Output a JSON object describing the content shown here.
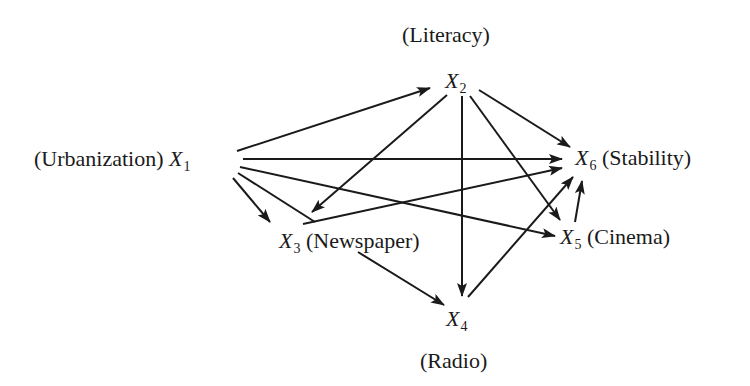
{
  "diagram": {
    "type": "path-diagram",
    "nodes": [
      {
        "id": "X1",
        "var": "X",
        "sub": "1",
        "label": "(Urbanization)",
        "label_side": "left"
      },
      {
        "id": "X2",
        "var": "X",
        "sub": "2",
        "label": "(Literacy)",
        "label_side": "above"
      },
      {
        "id": "X3",
        "var": "X",
        "sub": "3",
        "label": "(Newspaper)",
        "label_side": "right"
      },
      {
        "id": "X4",
        "var": "X",
        "sub": "4",
        "label": "(Radio)",
        "label_side": "below"
      },
      {
        "id": "X5",
        "var": "X",
        "sub": "5",
        "label": "(Cinema)",
        "label_side": "right"
      },
      {
        "id": "X6",
        "var": "X",
        "sub": "6",
        "label": "(Stability)",
        "label_side": "right"
      }
    ],
    "edges": [
      {
        "from": "X1",
        "to": "X2"
      },
      {
        "from": "X1",
        "to": "X6"
      },
      {
        "from": "X1",
        "to": "X5"
      },
      {
        "from": "X1",
        "to": "X3"
      },
      {
        "from": "X2",
        "to": "X3"
      },
      {
        "from": "X2",
        "to": "X4"
      },
      {
        "from": "X2",
        "to": "X5"
      },
      {
        "from": "X2",
        "to": "X6"
      },
      {
        "from": "X3",
        "to": "X4"
      },
      {
        "from": "X3",
        "to": "X6"
      },
      {
        "from": "X4",
        "to": "X6"
      },
      {
        "from": "X5",
        "to": "X6"
      }
    ],
    "line_color": "#1a1a1a"
  }
}
